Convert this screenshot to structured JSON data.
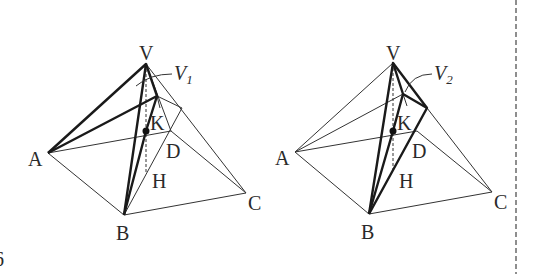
{
  "figure_number": "6",
  "figures": [
    {
      "id": "left",
      "labels": {
        "V": "V",
        "A": "A",
        "B": "B",
        "C": "C",
        "D": "D",
        "H": "H",
        "K": "K",
        "volume": "V",
        "volume_sub": "1"
      }
    },
    {
      "id": "right",
      "labels": {
        "V": "V",
        "A": "A",
        "B": "B",
        "C": "C",
        "D": "D",
        "H": "H",
        "K": "K",
        "volume": "V",
        "volume_sub": "2"
      }
    }
  ],
  "colors": {
    "line": "#333333",
    "thick": "#1a1a1a",
    "background": "#ffffff"
  }
}
